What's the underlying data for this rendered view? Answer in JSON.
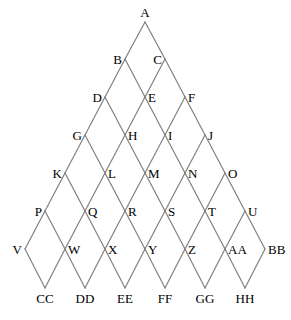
{
  "diagram": {
    "type": "lattice-graph",
    "canvas": {
      "width": 291,
      "height": 320
    },
    "style": {
      "line_color": "#808080",
      "line_width": 1.2,
      "label_color": "#000000",
      "background_color": "#ffffff",
      "label_font_size": 13
    },
    "geometry": {
      "apex_x": 145,
      "apex_y": 22,
      "row_spacing_y": 37.8,
      "col_spacing_x": 40,
      "rows": 8
    },
    "nodes": [
      {
        "id": "A",
        "label": "A",
        "row": 0,
        "col": 0,
        "x": 145,
        "y": 22,
        "anchor": "above"
      },
      {
        "id": "B",
        "label": "B",
        "row": 1,
        "col": 0,
        "x": 125,
        "y": 59,
        "anchor": "left"
      },
      {
        "id": "C",
        "label": "C",
        "row": 1,
        "col": 1,
        "x": 165,
        "y": 59,
        "anchor": "left"
      },
      {
        "id": "D",
        "label": "D",
        "row": 2,
        "col": 0,
        "x": 105,
        "y": 97,
        "anchor": "left"
      },
      {
        "id": "E",
        "label": "E",
        "row": 2,
        "col": 1,
        "x": 145,
        "y": 97,
        "anchor": "right"
      },
      {
        "id": "F",
        "label": "F",
        "row": 2,
        "col": 2,
        "x": 185,
        "y": 97,
        "anchor": "right"
      },
      {
        "id": "G",
        "label": "G",
        "row": 3,
        "col": 0,
        "x": 85,
        "y": 135,
        "anchor": "left"
      },
      {
        "id": "H",
        "label": "H",
        "row": 3,
        "col": 1,
        "x": 125,
        "y": 135,
        "anchor": "right"
      },
      {
        "id": "I",
        "label": "I",
        "row": 3,
        "col": 2,
        "x": 165,
        "y": 135,
        "anchor": "right"
      },
      {
        "id": "J",
        "label": "J",
        "row": 3,
        "col": 3,
        "x": 205,
        "y": 135,
        "anchor": "right"
      },
      {
        "id": "K",
        "label": "K",
        "row": 4,
        "col": 0,
        "x": 65,
        "y": 173,
        "anchor": "left"
      },
      {
        "id": "L",
        "label": "L",
        "row": 4,
        "col": 1,
        "x": 105,
        "y": 173,
        "anchor": "right"
      },
      {
        "id": "M",
        "label": "M",
        "row": 4,
        "col": 2,
        "x": 145,
        "y": 173,
        "anchor": "right"
      },
      {
        "id": "N",
        "label": "N",
        "row": 4,
        "col": 3,
        "x": 185,
        "y": 173,
        "anchor": "right"
      },
      {
        "id": "O",
        "label": "O",
        "row": 4,
        "col": 4,
        "x": 225,
        "y": 173,
        "anchor": "right"
      },
      {
        "id": "P",
        "label": "P",
        "row": 5,
        "col": 0,
        "x": 45,
        "y": 211,
        "anchor": "left"
      },
      {
        "id": "Q",
        "label": "Q",
        "row": 5,
        "col": 1,
        "x": 85,
        "y": 211,
        "anchor": "right"
      },
      {
        "id": "R",
        "label": "R",
        "row": 5,
        "col": 2,
        "x": 125,
        "y": 211,
        "anchor": "right"
      },
      {
        "id": "S",
        "label": "S",
        "row": 5,
        "col": 3,
        "x": 165,
        "y": 211,
        "anchor": "right"
      },
      {
        "id": "T",
        "label": "T",
        "row": 5,
        "col": 4,
        "x": 205,
        "y": 211,
        "anchor": "right"
      },
      {
        "id": "U",
        "label": "U",
        "row": 5,
        "col": 5,
        "x": 245,
        "y": 211,
        "anchor": "right"
      },
      {
        "id": "V",
        "label": "V",
        "row": 6,
        "col": 0,
        "x": 25,
        "y": 249,
        "anchor": "left"
      },
      {
        "id": "W",
        "label": "W",
        "row": 6,
        "col": 1,
        "x": 65,
        "y": 249,
        "anchor": "right"
      },
      {
        "id": "X",
        "label": "X",
        "row": 6,
        "col": 2,
        "x": 105,
        "y": 249,
        "anchor": "right"
      },
      {
        "id": "Y",
        "label": "Y",
        "row": 6,
        "col": 3,
        "x": 145,
        "y": 249,
        "anchor": "right"
      },
      {
        "id": "Z",
        "label": "Z",
        "row": 6,
        "col": 4,
        "x": 185,
        "y": 249,
        "anchor": "right"
      },
      {
        "id": "AA",
        "label": "AA",
        "row": 6,
        "col": 5,
        "x": 225,
        "y": 249,
        "anchor": "right"
      },
      {
        "id": "BB",
        "label": "BB",
        "row": 6,
        "col": 6,
        "x": 265,
        "y": 249,
        "anchor": "right"
      },
      {
        "id": "CC",
        "label": "CC",
        "row": 7,
        "col": 0,
        "x": 45,
        "y": 288,
        "anchor": "below"
      },
      {
        "id": "DD",
        "label": "DD",
        "row": 7,
        "col": 1,
        "x": 85,
        "y": 288,
        "anchor": "below"
      },
      {
        "id": "EE",
        "label": "EE",
        "row": 7,
        "col": 2,
        "x": 125,
        "y": 288,
        "anchor": "below"
      },
      {
        "id": "FF",
        "label": "FF",
        "row": 7,
        "col": 3,
        "x": 165,
        "y": 288,
        "anchor": "below"
      },
      {
        "id": "GG",
        "label": "GG",
        "row": 7,
        "col": 4,
        "x": 205,
        "y": 288,
        "anchor": "below"
      },
      {
        "id": "HH",
        "label": "HH",
        "row": 7,
        "col": 5,
        "x": 245,
        "y": 288,
        "anchor": "below"
      }
    ],
    "edges": [
      [
        "A",
        "B"
      ],
      [
        "A",
        "C"
      ],
      [
        "B",
        "D"
      ],
      [
        "B",
        "E"
      ],
      [
        "C",
        "E"
      ],
      [
        "C",
        "F"
      ],
      [
        "D",
        "G"
      ],
      [
        "D",
        "H"
      ],
      [
        "E",
        "H"
      ],
      [
        "E",
        "I"
      ],
      [
        "F",
        "I"
      ],
      [
        "F",
        "J"
      ],
      [
        "G",
        "K"
      ],
      [
        "G",
        "L"
      ],
      [
        "H",
        "L"
      ],
      [
        "H",
        "M"
      ],
      [
        "I",
        "M"
      ],
      [
        "I",
        "N"
      ],
      [
        "J",
        "N"
      ],
      [
        "J",
        "O"
      ],
      [
        "K",
        "P"
      ],
      [
        "K",
        "Q"
      ],
      [
        "L",
        "Q"
      ],
      [
        "L",
        "R"
      ],
      [
        "M",
        "R"
      ],
      [
        "M",
        "S"
      ],
      [
        "N",
        "S"
      ],
      [
        "N",
        "T"
      ],
      [
        "O",
        "T"
      ],
      [
        "O",
        "U"
      ],
      [
        "P",
        "V"
      ],
      [
        "P",
        "W"
      ],
      [
        "Q",
        "W"
      ],
      [
        "Q",
        "X"
      ],
      [
        "R",
        "X"
      ],
      [
        "R",
        "Y"
      ],
      [
        "S",
        "Y"
      ],
      [
        "S",
        "Z"
      ],
      [
        "T",
        "Z"
      ],
      [
        "T",
        "AA"
      ],
      [
        "U",
        "AA"
      ],
      [
        "U",
        "BB"
      ],
      [
        "V",
        "CC"
      ],
      [
        "W",
        "CC"
      ],
      [
        "W",
        "DD"
      ],
      [
        "X",
        "DD"
      ],
      [
        "X",
        "EE"
      ],
      [
        "Y",
        "EE"
      ],
      [
        "Y",
        "FF"
      ],
      [
        "Z",
        "FF"
      ],
      [
        "Z",
        "GG"
      ],
      [
        "AA",
        "GG"
      ],
      [
        "AA",
        "HH"
      ],
      [
        "BB",
        "HH"
      ]
    ]
  }
}
